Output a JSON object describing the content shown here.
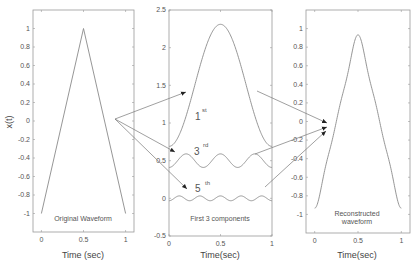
{
  "chart_data": [
    {
      "type": "line",
      "title": "",
      "annotation": "Original Waveform",
      "xlabel": "Time (sec)",
      "ylabel": "x(t)",
      "xlim": [
        -0.1,
        1.1
      ],
      "ylim": [
        -1.2,
        1.2
      ],
      "xticks": [
        "0",
        "0.5",
        "1"
      ],
      "yticks": [
        "1",
        "0.8",
        "0.6",
        "0.4",
        "0.2",
        "0",
        "-0.2",
        "-0.4",
        "-0.6",
        "-0.8",
        "-1"
      ],
      "series": [
        {
          "name": "triangle",
          "x": [
            0,
            0.5,
            1
          ],
          "y": [
            -1,
            1,
            -1
          ]
        }
      ]
    },
    {
      "type": "line",
      "title": "",
      "annotation": "First 3 components",
      "xlabel": "Time(sec)",
      "ylabel": "",
      "xlim": [
        0,
        1
      ],
      "ylim": [
        -0.5,
        2.5
      ],
      "xticks": [
        "0",
        "0.5",
        "1"
      ],
      "yticks": [
        "2.5",
        "2",
        "1.5",
        "1",
        "0.5",
        "0",
        "-0.5"
      ],
      "series": [
        {
          "name": "1st",
          "label": "1",
          "sup": "st",
          "offset": 1.5,
          "amplitude": 0.81,
          "harmonic": 1
        },
        {
          "name": "3rd",
          "label": "3",
          "sup": "rd",
          "offset": 0.5,
          "amplitude": 0.09,
          "harmonic": 3
        },
        {
          "name": "5th",
          "label": "5",
          "sup": "th",
          "offset": 0.0,
          "amplitude": 0.032,
          "harmonic": 5
        }
      ]
    },
    {
      "type": "line",
      "title": "",
      "annotation": "Reconstructed waveform",
      "annotation_lines": [
        "Reconstructed",
        "waveform"
      ],
      "xlabel": "Time(sec)",
      "ylabel": "",
      "xlim": [
        -0.1,
        1.1
      ],
      "ylim": [
        -1.2,
        1.2
      ],
      "xticks": [
        "0",
        "0.5",
        "1"
      ],
      "yticks": [
        "1",
        "0.8",
        "0.6",
        "0.4",
        "0.2",
        "0",
        "-0.2",
        "-0.4",
        "-0.6",
        "-0.8",
        "-1"
      ],
      "series": [
        {
          "name": "sum of 1st, 3rd, 5th harmonics",
          "peak": 0.93,
          "min": -0.93
        }
      ]
    }
  ],
  "labels": {
    "left_annotation": "Original Waveform",
    "left_xlabel": "Time (sec)",
    "left_ylabel": "x(t)",
    "mid_annotation": "First 3 components",
    "mid_xlabel": "Time(sec)",
    "right_annotation_1": "Reconstructed",
    "right_annotation_2": "waveform",
    "right_xlabel": "Time(sec)",
    "first": "1",
    "first_sup": "st",
    "third": "3",
    "third_sup": "rd",
    "fifth": "5",
    "fifth_sup": "th"
  },
  "ticks": {
    "x": [
      "0",
      "0.5",
      "1"
    ],
    "y_pm1": [
      "1",
      "0.8",
      "0.6",
      "0.4",
      "0.2",
      "0",
      "-0.2",
      "-0.4",
      "-0.6",
      "-0.8",
      "-1"
    ],
    "y_mid": [
      "2.5",
      "2",
      "1.5",
      "1",
      "0.5",
      "0",
      "-0.5"
    ]
  }
}
